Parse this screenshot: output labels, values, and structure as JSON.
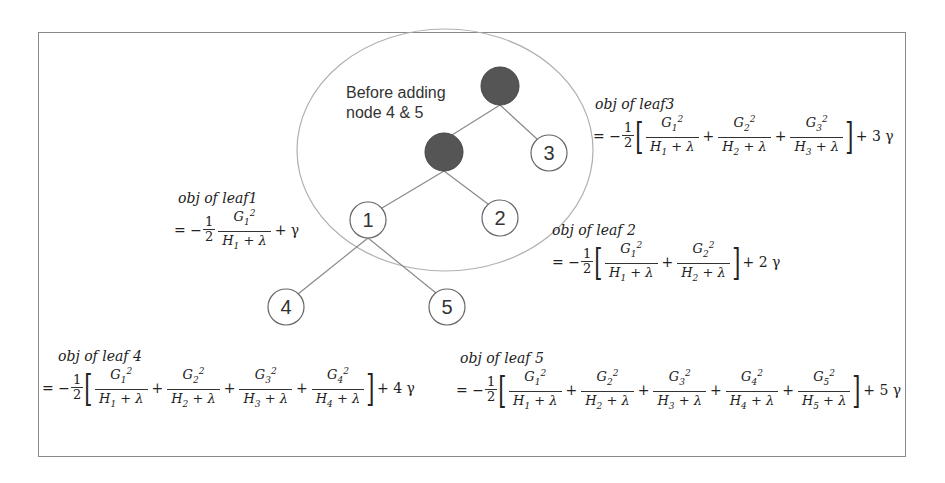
{
  "frame": {
    "border_color": "#8a8a8a"
  },
  "colors": {
    "internal_node": "#555555",
    "leaf_fill": "#ffffff",
    "edge": "#8a8a8a",
    "ellipse": "#b0b0b0"
  },
  "caption": {
    "line1": "Before adding",
    "line2": "node 4 & 5"
  },
  "tree": {
    "internal_nodes": [
      {
        "id": "root",
        "cx": 500,
        "cy": 86,
        "r": 19
      },
      {
        "id": "mid",
        "cx": 444,
        "cy": 152,
        "r": 19
      }
    ],
    "leaves": [
      {
        "id": "1",
        "label": "1",
        "cx": 368,
        "cy": 220,
        "r": 18
      },
      {
        "id": "2",
        "label": "2",
        "cx": 500,
        "cy": 218,
        "r": 18
      },
      {
        "id": "3",
        "label": "3",
        "cx": 549,
        "cy": 153,
        "r": 18
      },
      {
        "id": "4",
        "label": "4",
        "cx": 286,
        "cy": 307,
        "r": 18
      },
      {
        "id": "5",
        "label": "5",
        "cx": 447,
        "cy": 307,
        "r": 18
      }
    ],
    "edges": [
      [
        "root",
        "mid"
      ],
      [
        "root",
        "3"
      ],
      [
        "mid",
        "1"
      ],
      [
        "mid",
        "2"
      ],
      [
        "1",
        "4"
      ],
      [
        "1",
        "5"
      ]
    ],
    "ellipse": {
      "cx": 445,
      "cy": 150,
      "rx": 148,
      "ry": 121
    }
  },
  "formulas": {
    "leaf1": {
      "title": "obj of leaf1",
      "eq": "= −1/2 · G1²/(H1 + λ) + γ",
      "gamma": "+ γ"
    },
    "leaf2": {
      "title": "obj of leaf 2",
      "eq": "= −1/2 [ G1²/(H1+λ) + G2²/(H2+λ) ] + 2 γ",
      "gamma": "+ 2 γ"
    },
    "leaf3": {
      "title": "obj of leaf3",
      "eq": "= −1/2 [ G1²/(H1+λ) + G2²/(H2+λ) + G3²/(H3+λ) ] + 3 γ",
      "gamma": "+ 3 γ"
    },
    "leaf4": {
      "title": "obj of leaf 4",
      "eq": "= −1/2 [ G1²/(H1+λ) + ... + G4²/(H4+λ) ] + 4 γ",
      "gamma": "+ 4 γ"
    },
    "leaf5": {
      "title": "obj of leaf 5",
      "eq": "= −1/2 [ G1²/(H1+λ) + ... + G5²/(H5+λ) ] + 5 γ",
      "gamma": "+ 5 γ"
    }
  },
  "symbols": {
    "eq_prefix": "= −",
    "half_num": "1",
    "half_den": "2",
    "plus": "+",
    "lbracket": "[",
    "rbracket": "]",
    "den_suffix": " + λ"
  }
}
